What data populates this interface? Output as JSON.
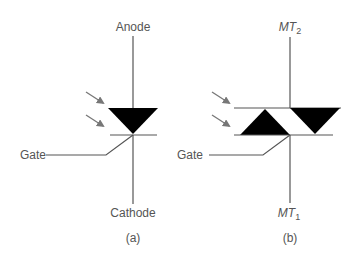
{
  "diagram": {
    "type": "semiconductor-symbols",
    "colors": {
      "wire": "#555555",
      "triangle": "#000000",
      "arrow": "#777777",
      "label": "#555555",
      "background": "#ffffff"
    },
    "left": {
      "name": "light-activated SCR",
      "top_label": "Anode",
      "bottom_label": "Cathode",
      "gate_label": "Gate",
      "caption": "(a)"
    },
    "right": {
      "name": "light-activated triac",
      "top_label_main": "MT",
      "top_label_sub": "2",
      "bottom_label_main": "MT",
      "bottom_label_sub": "1",
      "gate_label": "Gate",
      "caption": "(b)"
    }
  }
}
